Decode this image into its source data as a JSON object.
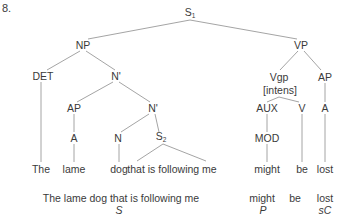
{
  "example_number": "8.",
  "tree": {
    "root": {
      "label": "S",
      "subscript": "1"
    },
    "np": "NP",
    "vp": "VP",
    "det": "DET",
    "nbar_outer": "N'",
    "ap_left": "AP",
    "nbar_inner": "N'",
    "a_left": "A",
    "n": "N",
    "s2": {
      "label": "S",
      "subscript": "2"
    },
    "vgp": "Vgp",
    "vgp_feature": "[intens]",
    "ap_right": "AP",
    "aux": "AUX",
    "v": "V",
    "a_right": "A",
    "mod": "MOD"
  },
  "leaves": {
    "the": "The",
    "lame": "lame",
    "dog": "dog",
    "clause": "that is following me",
    "might": "might",
    "be": "be",
    "lost": "lost"
  },
  "functional_analysis": {
    "subject_text": "The lame dog that is following me",
    "subject_label": "S",
    "predicator_text_1": "might",
    "predicator_text_2": "be",
    "predicator_label": "P",
    "complement_text": "lost",
    "complement_label": "sC"
  }
}
